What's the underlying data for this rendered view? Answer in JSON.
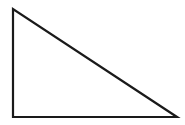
{
  "diagram": {
    "shape": "right-triangle",
    "stroke_color": "#1a1a1a",
    "fill_color": "#ffffff",
    "stroke_width": 2.2,
    "vertices": {
      "top_left": [
        13,
        9
      ],
      "bottom_left": [
        13,
        117
      ],
      "bottom_right": [
        177,
        117
      ]
    }
  }
}
